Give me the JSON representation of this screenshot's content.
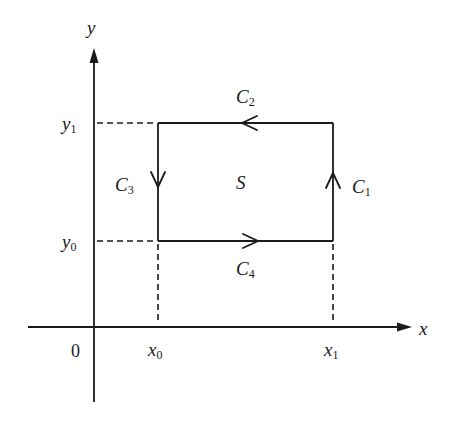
{
  "diagram": {
    "axes": {
      "x_label": "x",
      "y_label": "y",
      "origin_label": "0"
    },
    "ticks": {
      "x0": {
        "base": "x",
        "sub": "0"
      },
      "x1": {
        "base": "x",
        "sub": "1"
      },
      "y0": {
        "base": "y",
        "sub": "0"
      },
      "y1": {
        "base": "y",
        "sub": "1"
      }
    },
    "region_label": "S",
    "curves": {
      "c1": {
        "base": "C",
        "sub": "1",
        "direction": "up"
      },
      "c2": {
        "base": "C",
        "sub": "2",
        "direction": "left"
      },
      "c3": {
        "base": "C",
        "sub": "3",
        "direction": "down"
      },
      "c4": {
        "base": "C",
        "sub": "4",
        "direction": "right"
      }
    },
    "colors": {
      "stroke": "#1a1a1a",
      "background": "#ffffff"
    }
  }
}
